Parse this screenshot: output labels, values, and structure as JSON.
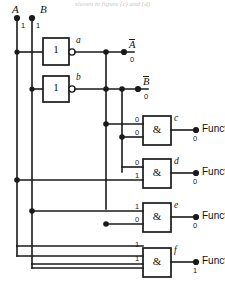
{
  "figure": {
    "title_fragment_cutoff": "shown in figure (c) and (d)",
    "kind": "logic-circuit-schematic"
  },
  "sources": [
    {
      "name": "A",
      "value": "1",
      "x": 17,
      "y": 24
    },
    {
      "name": "B",
      "value": "1",
      "x": 45,
      "y": 24
    }
  ],
  "inverters": [
    {
      "symbol": "1",
      "node": "a",
      "out_name": "A",
      "out_overbar": true,
      "out_value": "0"
    },
    {
      "symbol": "1",
      "node": "b",
      "out_name": "B",
      "out_overbar": true,
      "out_value": "0"
    }
  ],
  "and_gates": [
    {
      "symbol": "&",
      "node": "c",
      "inputs": [
        "0",
        "0"
      ],
      "output_label": "Function 0",
      "output_value": "0"
    },
    {
      "symbol": "&",
      "node": "d",
      "inputs": [
        "0",
        "1"
      ],
      "output_label": "Function1",
      "output_value": "0"
    },
    {
      "symbol": "&",
      "node": "e",
      "inputs": [
        "1",
        "0"
      ],
      "output_label": "Function2",
      "output_value": "0"
    },
    {
      "symbol": "&",
      "node": "f",
      "inputs": [
        "1",
        "1"
      ],
      "output_label": "Function 3",
      "output_value": "1"
    }
  ],
  "colors": {
    "ink": "#1a1a1a",
    "background": "#ffffff",
    "faded_text": "#c9c9c9"
  }
}
